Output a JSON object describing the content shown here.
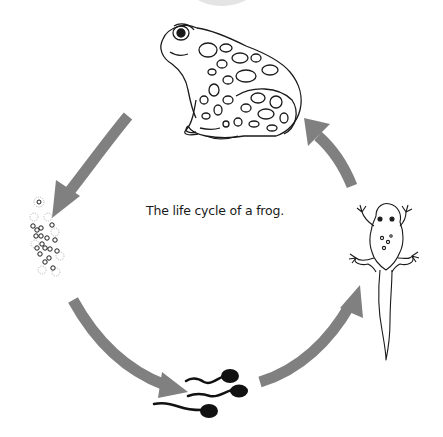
{
  "diagram": {
    "title": "The life cycle of a frog.",
    "stages": [
      {
        "id": "adult-frog",
        "label": "Adult frog",
        "position": "top"
      },
      {
        "id": "froglet",
        "label": "Froglet (tadpole with legs)",
        "position": "right"
      },
      {
        "id": "tadpoles",
        "label": "Tadpoles",
        "position": "bottom",
        "count": 3
      },
      {
        "id": "eggs",
        "label": "Frog spawn (eggs)",
        "position": "left"
      }
    ],
    "arrows": [
      {
        "from": "adult-frog",
        "to": "eggs",
        "direction": "down-left"
      },
      {
        "from": "eggs",
        "to": "tadpoles",
        "direction": "down-right"
      },
      {
        "from": "tadpoles",
        "to": "froglet",
        "direction": "up-right"
      },
      {
        "from": "froglet",
        "to": "adult-frog",
        "direction": "up-left"
      }
    ],
    "colors": {
      "arrow": "#808080",
      "line_art": "#1a1a1a",
      "background": "#ffffff"
    }
  }
}
